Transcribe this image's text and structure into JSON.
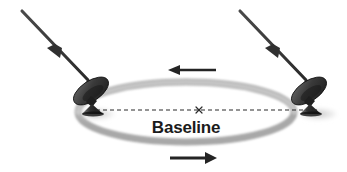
{
  "figure": {
    "type": "diagram",
    "background_color": "#ffffff",
    "width": 347,
    "height": 172
  },
  "labels": {
    "baseline": "Baseline"
  },
  "colors": {
    "ink": "#1b1b1b",
    "ray": "#3a3a3a",
    "ring_light": "#cfcfcf",
    "ring_mid": "#b4b4b4",
    "ring_dark": "#9a9a9a",
    "dish_dark": "#2b2b2b",
    "dish_mid": "#555555",
    "shadow": "#d8d8d8",
    "baseline_dash": "#2b2b2b"
  },
  "elements": {
    "ring": {
      "name": "earth-rotation-ring",
      "center": [
        186,
        112
      ],
      "rx": 108,
      "ry": 30,
      "stroke_width": 6
    },
    "baseline_line": {
      "name": "baseline-dashed-line",
      "x1": 96,
      "y1": 110,
      "x2": 318,
      "y2": 110,
      "dash": "4 3"
    },
    "center_marker": {
      "name": "baseline-center-x-marker",
      "x": 199,
      "y": 110,
      "size": 5,
      "glyph": "x"
    },
    "antennas": [
      {
        "name": "antenna-left",
        "base": [
          96,
          110
        ],
        "label": "left radio telescope"
      },
      {
        "name": "antenna-right",
        "base": [
          318,
          110
        ],
        "label": "right radio telescope"
      }
    ],
    "incoming_rays": [
      {
        "name": "incoming-wavefront-ray-left",
        "from": [
          22,
          11
        ],
        "to": [
          88,
          80
        ],
        "arrow_at": 0.47,
        "direction": "down-right"
      },
      {
        "name": "incoming-wavefront-ray-right",
        "from": [
          240,
          11
        ],
        "to": [
          306,
          80
        ],
        "arrow_at": 0.47,
        "direction": "down-right"
      }
    ],
    "rotation_arrows": [
      {
        "name": "rotation-arrow-top",
        "x1": 216,
        "y1": 70,
        "x2": 170,
        "y2": 70,
        "direction": "left"
      },
      {
        "name": "rotation-arrow-bottom",
        "x1": 170,
        "y1": 158,
        "x2": 216,
        "y2": 158,
        "direction": "right"
      }
    ]
  }
}
